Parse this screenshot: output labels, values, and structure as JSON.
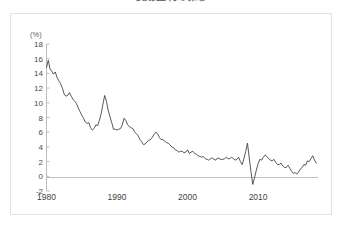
{
  "figure": {
    "title": "長期金利の推移",
    "background_color": "#ffffff",
    "border_color": "#e2e2e2"
  },
  "chart_data": {
    "type": "line",
    "title": "長期金利の推移",
    "xlabel": "",
    "ylabel": "(%)",
    "unit_label": "(%)",
    "xlim": [
      1980,
      2018.5
    ],
    "ylim": [
      -2,
      18
    ],
    "ytick_labels": [
      "18",
      "16",
      "14",
      "12",
      "10",
      "8",
      "6",
      "4",
      "2",
      "0",
      "-2"
    ],
    "ytick_values": [
      18,
      16,
      14,
      12,
      10,
      8,
      6,
      4,
      2,
      0,
      -2
    ],
    "xtick_labels": [
      "1980",
      "1990",
      "2000",
      "2010"
    ],
    "xtick_values": [
      1980,
      1990,
      2000,
      2010
    ],
    "grid": false,
    "legend": null,
    "zero_line": true,
    "line_color": "#3a3a3a",
    "series": [
      {
        "name": "長期金利",
        "x": [
          1980.0,
          1980.25,
          1980.5,
          1980.75,
          1981.0,
          1981.25,
          1981.5,
          1981.75,
          1982.0,
          1982.25,
          1982.5,
          1982.75,
          1983.0,
          1983.25,
          1983.5,
          1983.75,
          1984.0,
          1984.25,
          1984.5,
          1984.75,
          1985.0,
          1985.25,
          1985.5,
          1985.75,
          1986.0,
          1986.25,
          1986.5,
          1986.75,
          1987.0,
          1987.25,
          1987.5,
          1987.75,
          1988.0,
          1988.25,
          1988.5,
          1988.75,
          1989.0,
          1989.25,
          1989.5,
          1989.75,
          1990.0,
          1990.25,
          1990.5,
          1990.75,
          1991.0,
          1991.25,
          1991.5,
          1991.75,
          1992.0,
          1992.25,
          1992.5,
          1992.75,
          1993.0,
          1993.25,
          1993.5,
          1993.75,
          1994.0,
          1994.25,
          1994.5,
          1994.75,
          1995.0,
          1995.25,
          1995.5,
          1995.75,
          1996.0,
          1996.25,
          1996.5,
          1996.75,
          1997.0,
          1997.25,
          1997.5,
          1997.75,
          1998.0,
          1998.25,
          1998.5,
          1998.75,
          1999.0,
          1999.25,
          1999.5,
          1999.75,
          2000.0,
          2000.25,
          2000.5,
          2000.75,
          2001.0,
          2001.25,
          2001.5,
          2001.75,
          2002.0,
          2002.25,
          2002.5,
          2002.75,
          2003.0,
          2003.25,
          2003.5,
          2003.75,
          2004.0,
          2004.25,
          2004.5,
          2004.75,
          2005.0,
          2005.25,
          2005.5,
          2005.75,
          2006.0,
          2006.25,
          2006.5,
          2006.75,
          2007.0,
          2007.25,
          2007.5,
          2007.75,
          2008.0,
          2008.25,
          2008.5,
          2008.75,
          2009.0,
          2009.25,
          2009.5,
          2009.75,
          2010.0,
          2010.25,
          2010.5,
          2010.75,
          2011.0,
          2011.25,
          2011.5,
          2011.75,
          2012.0,
          2012.25,
          2012.5,
          2012.75,
          2013.0,
          2013.25,
          2013.5,
          2013.75,
          2014.0,
          2014.25,
          2014.5,
          2014.75,
          2015.0,
          2015.25,
          2015.5,
          2015.75,
          2016.0,
          2016.25,
          2016.5,
          2016.75,
          2017.0,
          2017.25,
          2017.5,
          2017.75,
          2018.0,
          2018.25
        ],
        "values": [
          14.8,
          15.8,
          14.6,
          14.3,
          13.9,
          14.2,
          13.4,
          13.0,
          12.6,
          12.0,
          11.2,
          10.9,
          11.0,
          11.4,
          10.9,
          10.5,
          10.2,
          9.9,
          9.3,
          8.8,
          8.3,
          7.9,
          7.4,
          7.2,
          7.3,
          6.6,
          6.3,
          6.5,
          7.0,
          6.9,
          7.6,
          8.5,
          9.8,
          11.0,
          10.2,
          9.0,
          8.1,
          7.3,
          6.4,
          6.4,
          6.3,
          6.4,
          6.5,
          7.0,
          7.9,
          7.6,
          7.0,
          6.8,
          6.6,
          6.5,
          6.0,
          5.8,
          5.5,
          5.0,
          4.7,
          4.3,
          4.4,
          4.7,
          4.9,
          5.0,
          5.3,
          5.7,
          6.0,
          5.8,
          5.3,
          5.0,
          5.0,
          4.8,
          4.6,
          4.5,
          4.3,
          4.0,
          3.9,
          3.6,
          3.5,
          3.3,
          3.4,
          3.4,
          3.2,
          3.3,
          3.6,
          3.1,
          3.3,
          3.4,
          3.1,
          3.0,
          2.8,
          2.7,
          2.6,
          2.7,
          2.4,
          2.3,
          2.2,
          2.4,
          2.5,
          2.3,
          2.2,
          2.5,
          2.4,
          2.3,
          2.3,
          2.4,
          2.6,
          2.4,
          2.4,
          2.6,
          2.4,
          2.2,
          2.3,
          2.6,
          2.0,
          1.6,
          2.4,
          3.4,
          4.5,
          2.5,
          0.6,
          -1.1,
          -0.2,
          0.8,
          1.7,
          2.3,
          2.2,
          2.6,
          2.9,
          2.7,
          2.4,
          2.2,
          2.1,
          2.3,
          1.9,
          1.6,
          1.6,
          1.8,
          1.4,
          1.2,
          1.2,
          1.5,
          1.1,
          0.7,
          0.4,
          0.5,
          0.3,
          0.6,
          1.0,
          1.2,
          1.6,
          1.5,
          2.1,
          2.0,
          2.4,
          2.8,
          2.2,
          1.8
        ]
      }
    ]
  }
}
